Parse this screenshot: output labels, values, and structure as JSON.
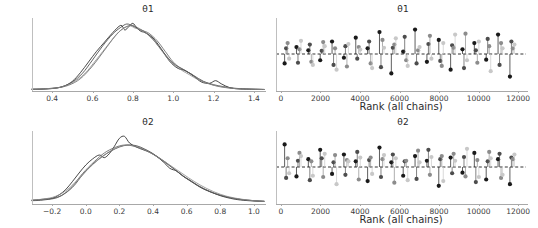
{
  "figure": {
    "width": 538,
    "height": 228,
    "background": "#ffffff",
    "n_chains": 4,
    "chain_colors": [
      "#1a1a1a",
      "#4d4d4d",
      "#8c8c8c",
      "#c8c8c8"
    ]
  },
  "panels": {
    "top_left": {
      "title": "θ1"
    },
    "top_right": {
      "title": "θ1",
      "xlabel": "Rank (all chains)"
    },
    "bottom_left": {
      "title": "θ2"
    },
    "bottom_right": {
      "title": "θ2",
      "xlabel": "Rank (all chains)"
    }
  },
  "chart_data": [
    {
      "id": "kde-theta1",
      "type": "line",
      "title": "θ1",
      "xlabel": "",
      "ylabel": "",
      "xlim": [
        0.3,
        1.45
      ],
      "ylim": [
        0,
        1.08
      ],
      "xticks": [
        0.4,
        0.6,
        0.8,
        1.0,
        1.2,
        1.4
      ],
      "xticklabels": [
        "0.4",
        "0.6",
        "0.8",
        "1.0",
        "1.2",
        "1.4"
      ],
      "grid": false,
      "legend": "none",
      "series": [
        {
          "name": "chain 0",
          "color": "#1a1a1a",
          "x": [
            0.3,
            0.34,
            0.38,
            0.42,
            0.46,
            0.5,
            0.54,
            0.58,
            0.62,
            0.66,
            0.7,
            0.74,
            0.76,
            0.78,
            0.8,
            0.82,
            0.84,
            0.86,
            0.9,
            0.94,
            0.98,
            1.02,
            1.06,
            1.1,
            1.14,
            1.18,
            1.21,
            1.24,
            1.28,
            1.32,
            1.38,
            1.45
          ],
          "y": [
            0.01,
            0.012,
            0.018,
            0.028,
            0.06,
            0.13,
            0.26,
            0.42,
            0.58,
            0.72,
            0.86,
            0.97,
            0.9,
            0.95,
            1.0,
            0.93,
            0.88,
            0.86,
            0.78,
            0.62,
            0.44,
            0.33,
            0.29,
            0.21,
            0.12,
            0.1,
            0.14,
            0.09,
            0.035,
            0.018,
            0.012,
            0.008
          ]
        },
        {
          "name": "chain 1",
          "color": "#3d3d3d",
          "x": [
            0.3,
            0.35,
            0.4,
            0.45,
            0.5,
            0.55,
            0.6,
            0.65,
            0.7,
            0.74,
            0.77,
            0.8,
            0.83,
            0.86,
            0.9,
            0.95,
            1.0,
            1.05,
            1.1,
            1.15,
            1.2,
            1.25,
            1.3,
            1.36,
            1.45
          ],
          "y": [
            0.012,
            0.016,
            0.026,
            0.05,
            0.12,
            0.25,
            0.45,
            0.66,
            0.84,
            0.94,
            0.99,
            0.96,
            0.91,
            0.87,
            0.76,
            0.57,
            0.4,
            0.31,
            0.22,
            0.13,
            0.08,
            0.05,
            0.028,
            0.016,
            0.008
          ]
        },
        {
          "name": "chain 2",
          "color": "#5f5f5f",
          "x": [
            0.3,
            0.36,
            0.42,
            0.48,
            0.54,
            0.6,
            0.66,
            0.71,
            0.75,
            0.79,
            0.82,
            0.85,
            0.88,
            0.92,
            0.96,
            1.0,
            1.04,
            1.09,
            1.13,
            1.18,
            1.23,
            1.29,
            1.35,
            1.45
          ],
          "y": [
            0.01,
            0.015,
            0.03,
            0.07,
            0.17,
            0.36,
            0.6,
            0.8,
            0.92,
            0.97,
            0.94,
            0.89,
            0.85,
            0.74,
            0.58,
            0.42,
            0.32,
            0.24,
            0.15,
            0.09,
            0.05,
            0.026,
            0.014,
            0.008
          ]
        },
        {
          "name": "chain 3",
          "color": "#8a8a8a",
          "x": [
            0.3,
            0.37,
            0.44,
            0.5,
            0.56,
            0.62,
            0.68,
            0.73,
            0.78,
            0.81,
            0.84,
            0.87,
            0.91,
            0.95,
            0.99,
            1.04,
            1.08,
            1.12,
            1.17,
            1.22,
            1.28,
            1.34,
            1.45
          ],
          "y": [
            0.012,
            0.02,
            0.04,
            0.11,
            0.24,
            0.46,
            0.69,
            0.87,
            0.96,
            0.93,
            0.9,
            0.84,
            0.72,
            0.56,
            0.41,
            0.3,
            0.23,
            0.16,
            0.1,
            0.06,
            0.03,
            0.016,
            0.008
          ]
        }
      ]
    },
    {
      "id": "rank-theta1",
      "type": "scatter",
      "title": "θ1",
      "xlabel": "Rank (all chains)",
      "ylabel": "",
      "xlim": [
        -250,
        12400
      ],
      "ylim": [
        -1.15,
        1.15
      ],
      "xticks": [
        0,
        2000,
        4000,
        6000,
        8000,
        10000,
        12000
      ],
      "xticklabels": [
        "0",
        "2000",
        "4000",
        "6000",
        "8000",
        "10000",
        "12000"
      ],
      "grid": false,
      "legend": "none",
      "reference_line": 0,
      "bins": 20,
      "series": [
        {
          "name": "chain 0",
          "color": "#1a1a1a",
          "values": [
            -0.3,
            0.22,
            0.12,
            -0.2,
            0.4,
            -0.12,
            0.52,
            0.18,
            0.7,
            -0.62,
            0.08,
            0.78,
            -0.25,
            0.45,
            -0.5,
            0.15,
            0.35,
            -0.18,
            0.62,
            -0.72
          ]
        },
        {
          "name": "chain 1",
          "color": "#4d4d4d",
          "values": [
            0.18,
            -0.28,
            0.3,
            0.1,
            -0.35,
            0.25,
            -0.15,
            0.4,
            -0.42,
            0.2,
            0.55,
            -0.3,
            0.32,
            -0.22,
            0.28,
            -0.45,
            0.12,
            0.48,
            -0.35,
            0.4
          ]
        },
        {
          "name": "chain 2",
          "color": "#8c8c8c",
          "values": [
            0.35,
            0.15,
            -0.25,
            0.38,
            0.18,
            -0.4,
            0.22,
            -0.3,
            0.45,
            0.3,
            -0.2,
            0.12,
            0.58,
            -0.38,
            0.2,
            0.65,
            -0.28,
            0.25,
            0.35,
            0.18
          ]
        },
        {
          "name": "chain 3",
          "color": "#c8c8c8",
          "values": [
            -0.15,
            0.42,
            -0.35,
            0.25,
            -0.5,
            0.32,
            0.14,
            -0.45,
            0.2,
            0.5,
            -0.38,
            0.22,
            -0.15,
            0.35,
            0.62,
            -0.2,
            0.4,
            -0.55,
            0.18,
            0.3
          ]
        }
      ]
    },
    {
      "id": "kde-theta2",
      "type": "line",
      "title": "θ2",
      "xlabel": "",
      "ylabel": "",
      "xlim": [
        -0.32,
        1.06
      ],
      "ylim": [
        0,
        1.08
      ],
      "xticks": [
        -0.2,
        0.0,
        0.2,
        0.4,
        0.6,
        0.8,
        1.0
      ],
      "xticklabels": [
        "−0.2",
        "0.0",
        "0.2",
        "0.4",
        "0.6",
        "0.8",
        "1.0"
      ],
      "grid": false,
      "legend": "none",
      "series": [
        {
          "name": "chain 0",
          "color": "#1a1a1a",
          "x": [
            -0.32,
            -0.28,
            -0.24,
            -0.2,
            -0.16,
            -0.12,
            -0.08,
            -0.04,
            0.0,
            0.04,
            0.08,
            0.11,
            0.14,
            0.17,
            0.2,
            0.23,
            0.26,
            0.3,
            0.34,
            0.38,
            0.42,
            0.46,
            0.5,
            0.54,
            0.58,
            0.62,
            0.68,
            0.74,
            0.8,
            0.86,
            0.92,
            1.0,
            1.06
          ],
          "y": [
            0.04,
            0.05,
            0.06,
            0.07,
            0.12,
            0.2,
            0.32,
            0.45,
            0.57,
            0.66,
            0.72,
            0.68,
            0.74,
            0.85,
            0.97,
            1.0,
            0.9,
            0.84,
            0.8,
            0.76,
            0.7,
            0.62,
            0.52,
            0.48,
            0.4,
            0.34,
            0.24,
            0.17,
            0.11,
            0.07,
            0.045,
            0.03,
            0.025
          ]
        },
        {
          "name": "chain 1",
          "color": "#3d3d3d",
          "x": [
            -0.32,
            -0.27,
            -0.22,
            -0.17,
            -0.12,
            -0.07,
            -0.02,
            0.04,
            0.1,
            0.15,
            0.2,
            0.25,
            0.3,
            0.35,
            0.4,
            0.46,
            0.52,
            0.58,
            0.64,
            0.7,
            0.77,
            0.84,
            0.92,
            1.0,
            1.06
          ],
          "y": [
            0.035,
            0.04,
            0.055,
            0.08,
            0.15,
            0.26,
            0.42,
            0.58,
            0.7,
            0.78,
            0.84,
            0.87,
            0.86,
            0.81,
            0.74,
            0.63,
            0.52,
            0.4,
            0.3,
            0.21,
            0.14,
            0.09,
            0.055,
            0.035,
            0.025
          ]
        },
        {
          "name": "chain 2",
          "color": "#5f5f5f",
          "x": [
            -0.32,
            -0.26,
            -0.2,
            -0.14,
            -0.08,
            -0.02,
            0.05,
            0.11,
            0.17,
            0.23,
            0.29,
            0.35,
            0.41,
            0.47,
            0.53,
            0.6,
            0.67,
            0.74,
            0.81,
            0.89,
            0.97,
            1.06
          ],
          "y": [
            0.04,
            0.05,
            0.07,
            0.12,
            0.25,
            0.44,
            0.62,
            0.75,
            0.83,
            0.87,
            0.85,
            0.8,
            0.72,
            0.62,
            0.5,
            0.37,
            0.26,
            0.17,
            0.11,
            0.065,
            0.04,
            0.025
          ]
        },
        {
          "name": "chain 3",
          "color": "#8a8a8a",
          "x": [
            -0.32,
            -0.25,
            -0.18,
            -0.11,
            -0.04,
            0.03,
            0.1,
            0.16,
            0.22,
            0.28,
            0.34,
            0.4,
            0.47,
            0.54,
            0.61,
            0.68,
            0.76,
            0.84,
            0.92,
            1.0,
            1.06
          ],
          "y": [
            0.045,
            0.06,
            0.1,
            0.2,
            0.37,
            0.55,
            0.7,
            0.8,
            0.86,
            0.86,
            0.81,
            0.73,
            0.62,
            0.5,
            0.38,
            0.27,
            0.17,
            0.1,
            0.06,
            0.035,
            0.025
          ]
        }
      ]
    },
    {
      "id": "rank-theta2",
      "type": "scatter",
      "title": "θ2",
      "xlabel": "Rank (all chains)",
      "ylabel": "",
      "xlim": [
        -250,
        12400
      ],
      "ylim": [
        -1.15,
        1.15
      ],
      "xticks": [
        0,
        2000,
        4000,
        6000,
        8000,
        10000,
        12000
      ],
      "xticklabels": [
        "0",
        "2000",
        "4000",
        "6000",
        "8000",
        "10000",
        "12000"
      ],
      "grid": false,
      "legend": "none",
      "reference_line": 0,
      "bins": 20,
      "series": [
        {
          "name": "chain 0",
          "color": "#1a1a1a",
          "values": [
            0.72,
            -0.3,
            0.25,
            0.55,
            -0.22,
            0.4,
            0.18,
            -0.45,
            0.62,
            0.15,
            -0.28,
            0.35,
            0.2,
            -0.6,
            0.3,
            -0.18,
            0.45,
            -0.4,
            0.25,
            -0.55
          ]
        },
        {
          "name": "chain 1",
          "color": "#4d4d4d",
          "values": [
            -0.35,
            0.2,
            -0.42,
            0.28,
            0.15,
            -0.25,
            0.48,
            0.22,
            -0.32,
            0.4,
            0.18,
            -0.38,
            0.55,
            0.25,
            -0.2,
            0.32,
            -0.48,
            0.18,
            0.42,
            0.3
          ]
        },
        {
          "name": "chain 2",
          "color": "#8c8c8c",
          "values": [
            0.28,
            0.45,
            0.18,
            -0.32,
            0.38,
            0.22,
            -0.4,
            0.3,
            0.25,
            -0.5,
            0.2,
            0.52,
            -0.25,
            0.35,
            0.42,
            -0.3,
            0.22,
            0.48,
            -0.35,
            0.25
          ]
        },
        {
          "name": "chain 3",
          "color": "#c8c8c8",
          "values": [
            -0.2,
            0.35,
            -0.28,
            0.42,
            -0.55,
            0.18,
            0.3,
            -0.22,
            0.38,
            0.28,
            -0.42,
            0.15,
            0.32,
            -0.45,
            0.2,
            0.58,
            -0.32,
            0.28,
            -0.25,
            0.4
          ]
        }
      ]
    }
  ]
}
